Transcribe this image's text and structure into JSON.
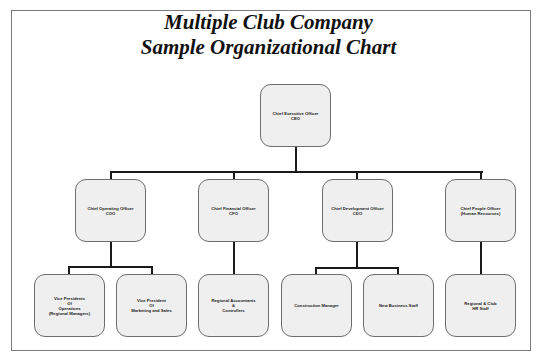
{
  "title": {
    "line1": "Multiple Club Company",
    "line2": "Sample Organizational Chart"
  },
  "nodes": {
    "ceo": {
      "lines": [
        "Chief Executive Officer",
        "CEO"
      ]
    },
    "coo": {
      "lines": [
        "Chief Operating Officer",
        "COO"
      ]
    },
    "cfo": {
      "lines": [
        "Chief Financial Officer",
        "CFO"
      ]
    },
    "cdo": {
      "lines": [
        "Chief Development Officer",
        "CDO"
      ]
    },
    "cpo": {
      "lines": [
        "Chief People Officer",
        "(Human Resources)"
      ]
    },
    "vp_operations": {
      "lines": [
        "Vice Presidents",
        "Of",
        "Operations",
        "(Regional Managers)"
      ]
    },
    "vp_marketing": {
      "lines": [
        "Vice President",
        "Of",
        "Marketing and Sales"
      ]
    },
    "regional_accountants": {
      "lines": [
        "Regional Accountants",
        "&",
        "Controllers"
      ]
    },
    "construction_manager": {
      "lines": [
        "Construction Manager"
      ]
    },
    "new_business_staff": {
      "lines": [
        "New Business Staff"
      ]
    },
    "hr_staff": {
      "lines": [
        "Regional & Club",
        "HR Staff"
      ]
    }
  },
  "hierarchy": {
    "ceo": [
      "coo",
      "cfo",
      "cdo",
      "cpo"
    ],
    "coo": [
      "vp_operations",
      "vp_marketing"
    ],
    "cfo": [
      "regional_accountants"
    ],
    "cdo": [
      "construction_manager",
      "new_business_staff"
    ],
    "cpo": [
      "hr_staff"
    ]
  },
  "colors": {
    "node_fill": "#efefef",
    "node_border": "#6e6e6e",
    "connector": "#1a1a1a",
    "frame": "#7a7a7a"
  }
}
